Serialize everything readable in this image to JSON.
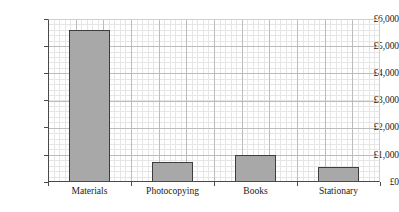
{
  "chart_data": {
    "type": "bar",
    "title": "",
    "subtitle": "",
    "xlabel": "",
    "ylabel": "",
    "categories": [
      "Materials",
      "Photocopying",
      "Books",
      "Stationary"
    ],
    "values": [
      5600,
      750,
      1000,
      560
    ],
    "ylim": [
      0,
      6000
    ],
    "ytick_values": [
      0,
      1000,
      2000,
      3000,
      4000,
      5000,
      6000
    ],
    "ytick_labels": [
      "£0",
      "£1,000",
      "£2,000",
      "£3,000",
      "£4,000",
      "£5,000",
      "£6,000"
    ],
    "grid": true,
    "grid_style": "graph-paper",
    "minor_divisions_per_major": 5,
    "legend": false,
    "legend_position": "none",
    "annotations": [],
    "currency_symbol": "£",
    "bar_color": "#a8a8a8",
    "bar_border_color": "#3d3d3d",
    "axis_color": "#4a4a4a",
    "major_grid_color": "#bcbcbc",
    "minor_grid_color": "#e6e6e6",
    "background_color": "#ffffff"
  }
}
